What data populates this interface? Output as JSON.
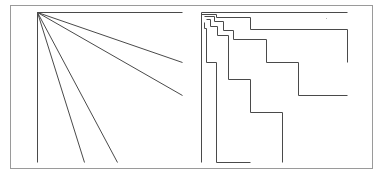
{
  "diagram": {
    "frame": {
      "x": 10,
      "y": 5,
      "width": 362,
      "height": 163,
      "stroke": "#9a9a9a"
    },
    "line_color": "#4a4a4a",
    "left_panel": {
      "name": "fan-lines",
      "origin": [
        37,
        12
      ],
      "lines": [
        {
          "id": "top",
          "to": [
            182,
            12
          ]
        },
        {
          "id": "ray-1",
          "to": [
            182,
            62
          ]
        },
        {
          "id": "ray-2",
          "to": [
            182,
            95
          ]
        },
        {
          "id": "ray-3",
          "to": [
            117,
            162
          ]
        },
        {
          "id": "ray-4",
          "to": [
            84,
            162
          ]
        },
        {
          "id": "vertical",
          "to": [
            37,
            162
          ]
        }
      ]
    },
    "right_panel": {
      "name": "staircase-paths",
      "paths": [
        {
          "id": "top-line",
          "points": [
            [
              201,
              12
            ],
            [
              347,
              12
            ]
          ]
        },
        {
          "id": "vertical-line",
          "points": [
            [
              201,
              12
            ],
            [
              201,
              162
            ]
          ]
        },
        {
          "id": "step-a",
          "points": [
            [
              201,
              14
            ],
            [
              216,
              14
            ],
            [
              216,
              17
            ],
            [
              250,
              17
            ],
            [
              250,
              29
            ],
            [
              347,
              29
            ],
            [
              347,
              62
            ]
          ]
        },
        {
          "id": "step-b",
          "points": [
            [
              204,
              16
            ],
            [
              214,
              16
            ],
            [
              214,
              21
            ],
            [
              223,
              21
            ],
            [
              223,
              30
            ],
            [
              233,
              30
            ],
            [
              233,
              39
            ],
            [
              266,
              39
            ],
            [
              266,
              62
            ],
            [
              298,
              62
            ],
            [
              298,
              95
            ],
            [
              347,
              95
            ]
          ]
        },
        {
          "id": "step-c",
          "points": [
            [
              206,
              19
            ],
            [
              210,
              19
            ],
            [
              210,
              26
            ],
            [
              217,
              26
            ],
            [
              217,
              35
            ],
            [
              228,
              35
            ],
            [
              228,
              79
            ],
            [
              250,
              79
            ],
            [
              250,
              112
            ],
            [
              282,
              112
            ],
            [
              282,
              162
            ]
          ]
        },
        {
          "id": "step-d",
          "points": [
            [
              204,
              22
            ],
            [
              204,
              28
            ],
            [
              206,
              28
            ],
            [
              206,
              62
            ],
            [
              216,
              62
            ],
            [
              216,
              162
            ],
            [
              250,
              162
            ]
          ]
        }
      ],
      "marker_dot": [
        326,
        18
      ]
    }
  }
}
